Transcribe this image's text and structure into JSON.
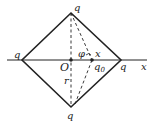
{
  "diagram": {
    "type": "physics-electrostatics",
    "labels": {
      "top_charge": "q",
      "bottom_charge": "q",
      "left_charge": "q",
      "right_charge": "q",
      "origin": "O",
      "test_charge": "q",
      "test_charge_sub": "0",
      "distance_x": "x",
      "angle": "φ",
      "distance_r": "r",
      "axis": "x"
    },
    "colors": {
      "line": "#222222",
      "background": "#ffffff"
    }
  }
}
